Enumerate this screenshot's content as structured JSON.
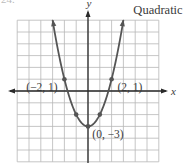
{
  "figure": {
    "exercise_number": "24.",
    "title": "Quadratic",
    "x_axis_label": "x",
    "y_axis_label": "y",
    "function": "y = x^2 - 3",
    "grid": {
      "xmin": -6,
      "xmax": 6,
      "ymin": -6,
      "ymax": 6,
      "step": 1
    },
    "points": [
      {
        "label": "(−2, 1)",
        "x": -2,
        "y": 1
      },
      {
        "label": "(2, 1)",
        "x": 2,
        "y": 1
      },
      {
        "label": "(0, −3)",
        "x": 0,
        "y": -3
      },
      {
        "label": "",
        "x": -1,
        "y": -2
      },
      {
        "label": "",
        "x": 1,
        "y": -2
      }
    ],
    "colors": {
      "grid": "#b8b8b8",
      "axis": "#2a2a2a",
      "curve": "#555555",
      "text": "#3a3a3a"
    }
  }
}
